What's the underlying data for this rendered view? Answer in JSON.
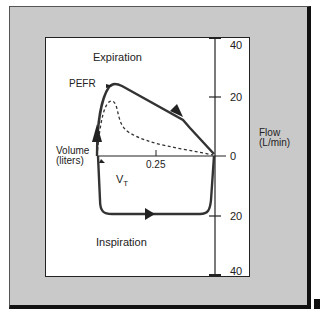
{
  "figure": {
    "type": "flow-volume loop diagram",
    "labels": {
      "expiration": "Expiration",
      "inspiration": "Inspiration",
      "pefr": "PEFR",
      "volume": "Volume",
      "volume_unit": "(liters)",
      "flow": "Flow",
      "flow_unit": "(L/min)",
      "vt": "V",
      "vt_sub": "T",
      "x_tick": "0.25"
    },
    "y_ticks": [
      "40",
      "20",
      "0",
      "20",
      "40"
    ],
    "colors": {
      "panel": "#c9c9c9",
      "plot_bg": "#ffffff",
      "curve": "#333333"
    }
  }
}
